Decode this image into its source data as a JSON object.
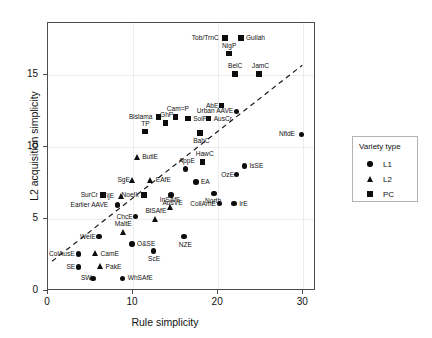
{
  "chart_data": {
    "type": "scatter",
    "title": "",
    "xlabel": "Rule simplicity",
    "ylabel": "L2 acquisition simplicity",
    "xlim": [
      0,
      31.5
    ],
    "ylim": [
      0,
      18.6
    ],
    "xticks": [
      0,
      10,
      20,
      30
    ],
    "yticks": [
      0,
      5,
      10,
      15
    ],
    "grid": true,
    "legend": {
      "title": "Variety type",
      "position": "right",
      "entries": [
        {
          "label": "L1",
          "marker": "circle"
        },
        {
          "label": "L2",
          "marker": "triangle"
        },
        {
          "label": "PC",
          "marker": "square"
        }
      ]
    },
    "trendline": {
      "style": "dashed",
      "x0": 0.6,
      "y0": 2.0,
      "x1": 30.0,
      "y1": 15.6
    },
    "points": [
      {
        "label": "Tob/TrnC",
        "type": "PC",
        "x": 20.9,
        "y": 17.5,
        "lpos": "left"
      },
      {
        "label": "Gullah",
        "type": "PC",
        "x": 22.8,
        "y": 17.5,
        "lpos": "right"
      },
      {
        "label": "NigP",
        "type": "PC",
        "x": 21.4,
        "y": 16.4,
        "lpos": "above"
      },
      {
        "label": "BelC",
        "type": "PC",
        "x": 22.1,
        "y": 15.0,
        "lpos": "above"
      },
      {
        "label": "JamC",
        "type": "PC",
        "x": 24.9,
        "y": 15.0,
        "lpos": "above"
      },
      {
        "label": "Bislama",
        "type": "PC",
        "x": 13.1,
        "y": 12.0,
        "lpos": "left"
      },
      {
        "label": "Cam=P",
        "type": "PC",
        "x": 15.1,
        "y": 12.0,
        "lpos": "above"
      },
      {
        "label": "SolP",
        "type": "PC",
        "x": 16.6,
        "y": 11.9,
        "lpos": "right"
      },
      {
        "label": "AusCr",
        "type": "PC",
        "x": 19.0,
        "y": 11.9,
        "lpos": "right"
      },
      {
        "label": "GhP",
        "type": "PC",
        "x": 13.9,
        "y": 11.6,
        "lpos": "above"
      },
      {
        "label": "TP",
        "type": "PC",
        "x": 11.5,
        "y": 11.0,
        "lpos": "above"
      },
      {
        "label": "AbE",
        "type": "PC",
        "x": 20.5,
        "y": 12.8,
        "lpos": "left"
      },
      {
        "label": "BahC",
        "type": "PC",
        "x": 18.0,
        "y": 10.9,
        "lpos": "below"
      },
      {
        "label": "Urban AAVE",
        "type": "L1",
        "x": 22.3,
        "y": 12.4,
        "lpos": "left"
      },
      {
        "label": "NfldE",
        "type": "L1",
        "x": 29.9,
        "y": 10.8,
        "lpos": "left"
      },
      {
        "label": "ButlE",
        "type": "L2",
        "x": 10.6,
        "y": 9.2,
        "lpos": "right"
      },
      {
        "label": "HawC",
        "type": "PC",
        "x": 18.3,
        "y": 8.9,
        "lpos": "above"
      },
      {
        "label": "AppE",
        "type": "L1",
        "x": 16.3,
        "y": 8.4,
        "lpos": "above"
      },
      {
        "label": "SgE",
        "type": "L2",
        "x": 10.1,
        "y": 7.6,
        "lpos": "left"
      },
      {
        "label": "EAfE",
        "type": "L2",
        "x": 12.2,
        "y": 7.6,
        "lpos": "right"
      },
      {
        "label": "EA",
        "type": "L1",
        "x": 17.5,
        "y": 7.5,
        "lpos": "right"
      },
      {
        "label": "IsSE",
        "type": "L1",
        "x": 23.2,
        "y": 8.6,
        "lpos": "right"
      },
      {
        "label": "OzE",
        "type": "L1",
        "x": 22.3,
        "y": 8.0,
        "lpos": "left"
      },
      {
        "label": "SurCr",
        "type": "PC",
        "x": 6.6,
        "y": 6.6,
        "lpos": "left"
      },
      {
        "label": "FijE",
        "type": "L2",
        "x": 8.8,
        "y": 6.5,
        "lpos": "left"
      },
      {
        "label": "NoeIk",
        "type": "PC",
        "x": 11.4,
        "y": 6.6,
        "lpos": "left"
      },
      {
        "label": "AusVE",
        "type": "L1",
        "x": 14.6,
        "y": 6.6,
        "lpos": "below"
      },
      {
        "label": "North",
        "type": "L1",
        "x": 19.6,
        "y": 6.7,
        "lpos": "below"
      },
      {
        "label": "Earlier AAVE",
        "type": "L1",
        "x": 8.3,
        "y": 5.9,
        "lpos": "left"
      },
      {
        "label": "InSAfE",
        "type": "L2",
        "x": 14.5,
        "y": 5.7,
        "lpos": "above"
      },
      {
        "label": "CollAmE",
        "type": "L1",
        "x": 20.3,
        "y": 6.0,
        "lpos": "left"
      },
      {
        "label": "IrE",
        "type": "L1",
        "x": 22.0,
        "y": 6.0,
        "lpos": "right"
      },
      {
        "label": "BlSAfE",
        "type": "L2",
        "x": 12.8,
        "y": 4.9,
        "lpos": "above"
      },
      {
        "label": "ChcE",
        "type": "L1",
        "x": 10.4,
        "y": 5.1,
        "lpos": "left"
      },
      {
        "label": "MaltE",
        "type": "L2",
        "x": 9.0,
        "y": 4.0,
        "lpos": "above"
      },
      {
        "label": "WelE",
        "type": "L1",
        "x": 6.1,
        "y": 3.7,
        "lpos": "left"
      },
      {
        "label": "NZE",
        "type": "L1",
        "x": 16.1,
        "y": 3.7,
        "lpos": "below"
      },
      {
        "label": "O&SE",
        "type": "L1",
        "x": 10.0,
        "y": 3.2,
        "lpos": "right"
      },
      {
        "label": "ScE",
        "type": "L1",
        "x": 12.5,
        "y": 2.7,
        "lpos": "below"
      },
      {
        "label": "ColAusE",
        "type": "L1",
        "x": 3.7,
        "y": 2.5,
        "lpos": "left"
      },
      {
        "label": "CamE",
        "type": "L2",
        "x": 5.7,
        "y": 2.5,
        "lpos": "right"
      },
      {
        "label": "SE",
        "type": "L1",
        "x": 3.7,
        "y": 1.6,
        "lpos": "left"
      },
      {
        "label": "PakE",
        "type": "L2",
        "x": 6.3,
        "y": 1.6,
        "lpos": "right"
      },
      {
        "label": "SW",
        "type": "L1",
        "x": 5.4,
        "y": 0.8,
        "lpos": "left"
      },
      {
        "label": "WhSAfE",
        "type": "L1",
        "x": 8.9,
        "y": 0.8,
        "lpos": "right"
      }
    ]
  }
}
